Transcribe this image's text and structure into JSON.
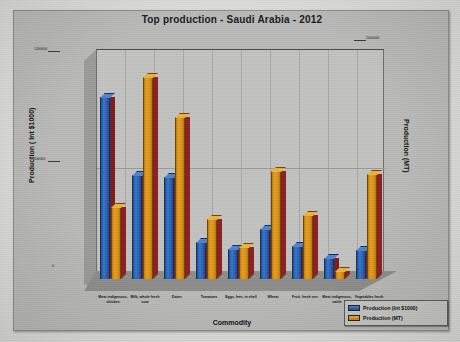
{
  "chart": {
    "title": "Top production - Saudi Arabia - 2012",
    "xlabel": "Commodity",
    "ylabel_left": "Production ( Int $1000)",
    "ylabel_right": "Production (MT)"
  },
  "legend": {
    "items": [
      {
        "label": "Production (Int $1000)",
        "color": "#2a5daf"
      },
      {
        "label": "Production (MT)",
        "color": "#d6901a"
      }
    ]
  },
  "axis": {
    "left_ticks": [
      "1200000",
      "600000",
      "0"
    ],
    "right_ticks": [
      "2000000",
      "1000000",
      "0"
    ]
  },
  "chart_data": {
    "type": "bar",
    "title": "Top production - Saudi Arabia - 2012",
    "xlabel": "Commodity",
    "ylabel": "Production ( Int $1000)",
    "ylabel_secondary": "Production (MT)",
    "grid": true,
    "legend_position": "bottom-right",
    "ylim": [
      0,
      1200000
    ],
    "ylim_secondary": [
      0,
      2000000
    ],
    "yticks": [
      0,
      600000,
      1200000
    ],
    "yticks_secondary": [
      0,
      1000000,
      2000000
    ],
    "categories": [
      "Meat indigenous, chicken",
      "Milk, whole fresh cow",
      "Dates",
      "Tomatoes",
      "Eggs, hen, in shell",
      "Wheat",
      "Fruit, fresh nes",
      "Meat indigenous, cattle",
      "Vegetables fresh nes"
    ],
    "series": [
      {
        "name": "Production (Int $1000)",
        "axis": "left",
        "color": "#2a5daf",
        "values": [
          1050000,
          600000,
          590000,
          215000,
          175000,
          290000,
          190000,
          120000,
          165000
        ]
      },
      {
        "name": "Production (MT)",
        "axis": "right",
        "color": "#d6901a",
        "values": [
          690000,
          1940000,
          1560000,
          580000,
          305000,
          1040000,
          620000,
          80000,
          1010000
        ]
      }
    ]
  }
}
